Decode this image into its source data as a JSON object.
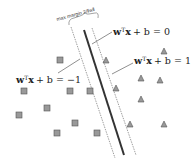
{
  "diagram": {
    "margin_label": "max margin 2/‖w‖",
    "equations": {
      "hyperplane": {
        "w": "w",
        "sup": "T",
        "x": "x",
        "rest": "+ b = 0"
      },
      "positive": {
        "w": "w",
        "sup": "T",
        "x": "x",
        "rest": "+ b = 1"
      },
      "negative": {
        "w": "w",
        "sup": "T",
        "x": "x",
        "rest": "+ b = −1"
      }
    },
    "colors": {
      "hyperplane": "#333333",
      "margin_lines": "#888888",
      "square_fill": "#999999",
      "square_stroke": "#555555",
      "triangle_fill": "#999999",
      "triangle_stroke": "#555555"
    },
    "classes": [
      {
        "name": "negative",
        "marker": "square",
        "count": 9
      },
      {
        "name": "positive",
        "marker": "triangle",
        "count": 8
      }
    ]
  }
}
